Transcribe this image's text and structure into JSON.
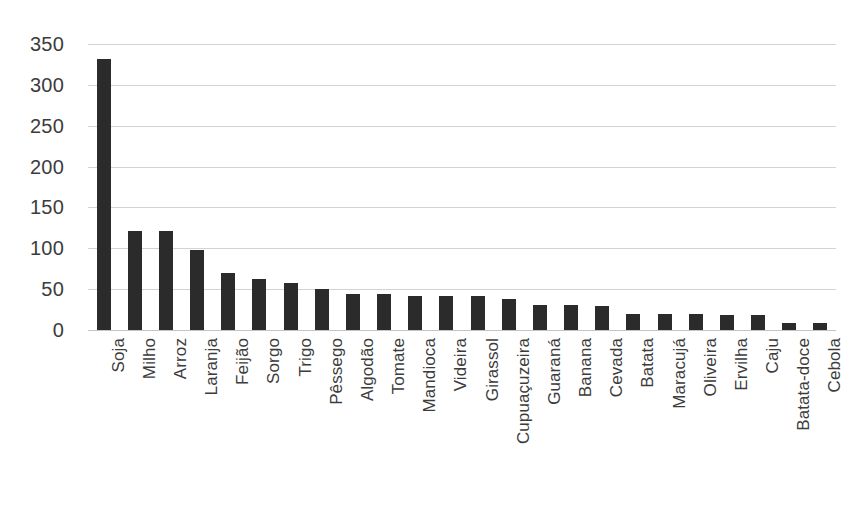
{
  "chart_data": {
    "type": "bar",
    "title": "",
    "subtitle": "",
    "xlabel": "",
    "ylabel": "",
    "ylim": [
      0,
      350
    ],
    "yticks": [
      0,
      50,
      100,
      150,
      200,
      250,
      300,
      350
    ],
    "grid": true,
    "legend": null,
    "bar_color": "#2b2b2b",
    "gridline_color": "#d2d2d2",
    "background_color": "#ffffff",
    "orientation": "vertical",
    "categories": [
      "Soja",
      "Milho",
      "Arroz",
      "Laranja",
      "Feijão",
      "Sorgo",
      "Trigo",
      "Pêssego",
      "Algodão",
      "Tomate",
      "Mandioca",
      "Videira",
      "Girassol",
      "Cupuaçuzeira",
      "Guaraná",
      "Banana",
      "Cevada",
      "Batata",
      "Maracujá",
      "Oliveira",
      "Ervilha",
      "Caju",
      "Batata-doce",
      "Cebola"
    ],
    "values": [
      332,
      121,
      121,
      98,
      70,
      63,
      57,
      50,
      44,
      44,
      42,
      42,
      42,
      38,
      31,
      31,
      29,
      20,
      19,
      19,
      18,
      18,
      8,
      8
    ]
  }
}
